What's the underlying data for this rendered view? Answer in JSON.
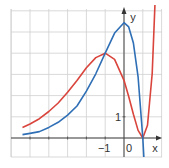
{
  "chart_data": {
    "type": "line",
    "title": "",
    "xlabel": "x",
    "ylabel": "y",
    "xlim": [
      -6,
      2
    ],
    "ylim": [
      -1,
      6
    ],
    "grid": true,
    "x_ticks": [
      {
        "value": -1,
        "label": "−1"
      },
      {
        "value": 0,
        "label": "0"
      }
    ],
    "y_ticks": [
      {
        "value": 1,
        "label": "1"
      }
    ],
    "series": [
      {
        "name": "red curve",
        "color": "#d9453c",
        "x": [
          -5.4,
          -5,
          -4.5,
          -4,
          -3.5,
          -3,
          -2.5,
          -2,
          -1.5,
          -1,
          -0.5,
          0,
          0.25,
          0.5,
          0.75,
          1,
          1.25,
          1.5,
          1.75,
          1.9
        ],
        "y": [
          0.5,
          0.66,
          0.91,
          1.25,
          1.65,
          2.16,
          2.71,
          3.31,
          3.79,
          4.0,
          3.71,
          2.72,
          1.96,
          1.12,
          0.36,
          0.0,
          0.6,
          3.04,
          8.6,
          13.4
        ]
      },
      {
        "name": "blue curve",
        "color": "#2f6fb5",
        "x": [
          -5.4,
          -5,
          -4.5,
          -4,
          -3.5,
          -3,
          -2.5,
          -2,
          -1.5,
          -1,
          -0.5,
          0,
          0.25,
          0.5,
          0.75,
          1,
          1.1
        ],
        "y": [
          0.16,
          0.22,
          0.3,
          0.5,
          0.74,
          1.08,
          1.51,
          2.21,
          3.03,
          4.0,
          4.95,
          5.44,
          5.24,
          4.48,
          2.88,
          0.0,
          -1.6
        ]
      }
    ]
  }
}
